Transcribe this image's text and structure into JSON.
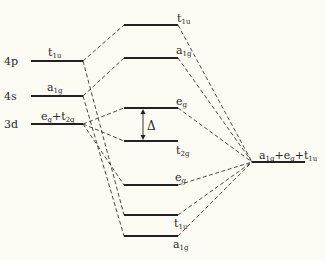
{
  "diagram": {
    "type": "molecular orbital energy-level diagram (octahedral complex, sigma bonding)",
    "colors": {
      "background": "#fbfbf3",
      "line": "#222222"
    },
    "metal_orbitals": [
      {
        "atomic": "4p",
        "symmetry": "t",
        "sub": "1u"
      },
      {
        "atomic": "4s",
        "symmetry": "a",
        "sub": "1g"
      },
      {
        "atomic": "3d",
        "symmetry": "e",
        "sub": "g",
        "plus": "+",
        "symmetry2": "t",
        "sub2": "2g"
      }
    ],
    "molecular_orbitals": [
      {
        "symmetry": "t",
        "sub": "1u"
      },
      {
        "symmetry": "a",
        "sub": "1g"
      },
      {
        "symmetry": "e",
        "sub": "g"
      },
      {
        "symmetry": "t",
        "sub": "2g"
      },
      {
        "symmetry": "e",
        "sub": "g"
      },
      {
        "symmetry": "t",
        "sub": "1u"
      },
      {
        "symmetry": "a",
        "sub": "1g"
      }
    ],
    "splitting_label": "Δ",
    "ligand_orbitals": {
      "parts": [
        {
          "symmetry": "a",
          "sub": "1g"
        },
        {
          "symmetry": "e",
          "sub": "g"
        },
        {
          "symmetry": "t",
          "sub": "1u"
        }
      ],
      "plus": "+"
    }
  }
}
